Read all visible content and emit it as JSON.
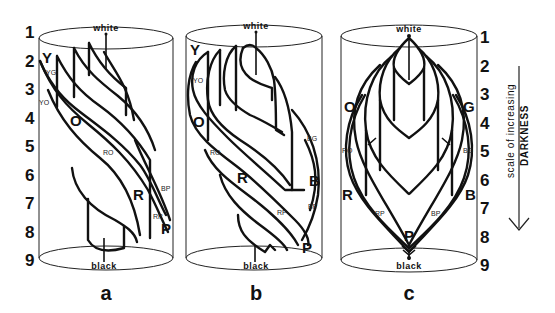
{
  "scale": {
    "numbers": [
      "1",
      "2",
      "3",
      "4",
      "5",
      "6",
      "7",
      "8",
      "9"
    ],
    "arrow_label_line1": "scale of increasing",
    "arrow_label_line2": "DARKNESS"
  },
  "panels": [
    {
      "id": "a",
      "label": "a",
      "top_pole": "white",
      "bottom_pole": "black",
      "hue_labels": {
        "Y": "Y",
        "YG": "YG",
        "YO": "YO",
        "O": "O",
        "RO": "RO",
        "R": "R",
        "BP": "BP",
        "RP": "RP",
        "P": "P"
      }
    },
    {
      "id": "b",
      "label": "b",
      "top_pole": "white",
      "bottom_pole": "black",
      "hue_labels": {
        "Y": "Y",
        "YO": "YO",
        "O": "O",
        "RO": "RO",
        "R": "R",
        "BG": "BG",
        "B": "B",
        "RP": "RP",
        "BP": "BP",
        "P": "P"
      }
    },
    {
      "id": "c",
      "label": "c",
      "top_pole": "white",
      "bottom_pole": "black",
      "hue_labels": {
        "O": "O",
        "G": "G",
        "RO": "RO",
        "BG": "BG",
        "R": "R",
        "B": "B",
        "RP": "RP",
        "BP": "BP",
        "P": "P"
      }
    }
  ]
}
